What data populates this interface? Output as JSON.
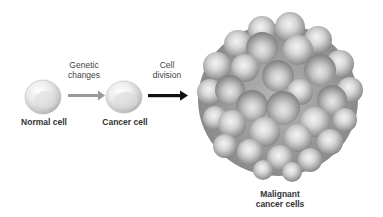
{
  "diagram": {
    "stages": [
      {
        "id": "normal",
        "label": "Normal cell"
      },
      {
        "id": "cancer",
        "label": "Cancer cell"
      },
      {
        "id": "malignant",
        "label_line1": "Malignant",
        "label_line2": "cancer cells"
      }
    ],
    "transitions": [
      {
        "from": "normal",
        "to": "cancer",
        "line1": "Genetic",
        "line2": "changes",
        "arrow_color": "#9a9a9a"
      },
      {
        "from": "cancer",
        "to": "malignant",
        "line1": "Cell",
        "line2": "division",
        "arrow_color": "#111111"
      }
    ],
    "colors": {
      "cell_light": "#f2f2f2",
      "cell_mid": "#cfcfcf",
      "cell_dark": "#8a8a8a"
    }
  }
}
